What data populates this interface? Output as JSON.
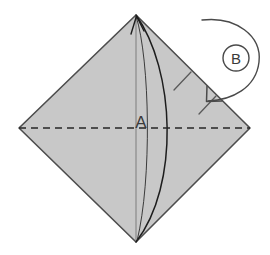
{
  "figure": {
    "type": "origami-fold-diagram",
    "title": "",
    "background_color": "#ffffff",
    "paper": {
      "name": "square-sheet-diamond-orientation",
      "fill_color": "#c8c8c8",
      "stroke_color": "#4d4d4d",
      "stroke_width": 1.6,
      "vertices": {
        "top": [
          136,
          15
        ],
        "right": [
          250,
          128
        ],
        "bottom": [
          136,
          242
        ],
        "left": [
          19,
          128
        ]
      }
    },
    "center_line": {
      "name": "vertical-center-crease",
      "from": [
        136,
        15
      ],
      "to": [
        136,
        242
      ],
      "stroke_color": "#6e6e6e",
      "stroke_width": 0.9,
      "style": "solid"
    },
    "fold_line": {
      "name": "horizontal-dashed-fold",
      "from": [
        19,
        128
      ],
      "to": [
        250,
        128
      ],
      "stroke_color": "#2b2b2b",
      "stroke_width": 1.5,
      "style": "dashed",
      "dash_pattern": "7 5"
    },
    "flap_curve": {
      "name": "flap-edge-curve",
      "from": [
        136,
        15
      ],
      "to": [
        136,
        242
      ],
      "bulge_direction": "right",
      "stroke_color": "#1a1a1a",
      "stroke_width": 1.5
    },
    "arrow_a": {
      "name": "fold-arrow-a",
      "label": "A",
      "label_position": [
        141,
        128
      ],
      "head_at": [
        136,
        17
      ],
      "description": "arrow pointing up to top apex indicating flap A folds up"
    },
    "arrow_b": {
      "name": "fold-arrow-b",
      "label": "B",
      "circle_center": [
        236,
        58
      ],
      "circle_radius": 13,
      "head_at": [
        207,
        102
      ],
      "stroke_color": "#4a4a4a",
      "stroke_width": 1.4,
      "description": "curved arrow wrapping from top around circled label B down to right edge"
    },
    "tick_marks": [
      {
        "name": "hinge-tick-upper",
        "from": [
          175,
          90
        ],
        "to": [
          192,
          73
        ]
      },
      {
        "name": "hinge-tick-lower",
        "from": [
          200,
          113
        ],
        "to": [
          217,
          96
        ]
      }
    ],
    "labels": {
      "a": "A",
      "b": "B"
    }
  }
}
